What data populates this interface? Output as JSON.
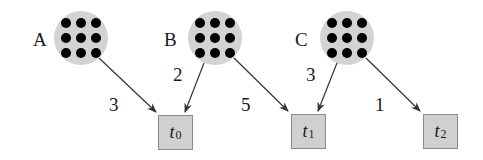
{
  "nodes": [
    {
      "id": "A",
      "label": "A",
      "cx": 81,
      "cy": 38
    },
    {
      "id": "B",
      "label": "B",
      "cx": 215,
      "cy": 38
    },
    {
      "id": "C",
      "label": "C",
      "cx": 347,
      "cy": 38
    }
  ],
  "targets": [
    {
      "id": "t0",
      "base": "t",
      "sub": "0",
      "x": 158,
      "y": 115
    },
    {
      "id": "t1",
      "base": "t",
      "sub": "1",
      "x": 291,
      "y": 114
    },
    {
      "id": "t2",
      "base": "t",
      "sub": "2",
      "x": 423,
      "y": 114
    }
  ],
  "edges": [
    {
      "from": "A",
      "to": "t0",
      "weight": "3"
    },
    {
      "from": "B",
      "to": "t0",
      "weight": "2"
    },
    {
      "from": "B",
      "to": "t1",
      "weight": "5"
    },
    {
      "from": "C",
      "to": "t1",
      "weight": "3"
    },
    {
      "from": "C",
      "to": "t2",
      "weight": "1"
    }
  ],
  "colors": {
    "circle_fill": "#d3d3d3",
    "dot": "#000000",
    "box_fill": "#d0d0d0",
    "box_border": "#8a8a8a",
    "arrow": "#333333"
  }
}
